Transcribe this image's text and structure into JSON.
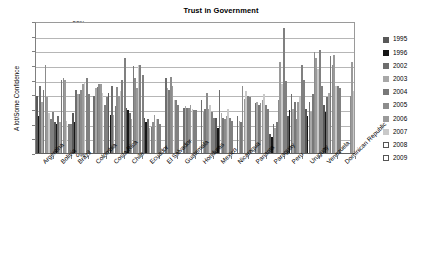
{
  "chart_data": {
    "type": "bar",
    "title": "Trust in Government",
    "xlabel": "",
    "ylabel": "A lot/Some Confidence",
    "ylim": [
      0,
      90
    ],
    "ytick_labels": [
      "0%",
      "10%",
      "20%",
      "30%",
      "40%",
      "50%",
      "60%",
      "70%",
      "80%",
      "90%"
    ],
    "ytick_values": [
      0,
      10,
      20,
      30,
      40,
      50,
      60,
      70,
      80,
      90
    ],
    "grid": true,
    "legend_position": "right",
    "categories": [
      "Argentina",
      "Bolivia",
      "Brazil",
      "Colombia",
      "Costa Rica",
      "Chile",
      "Ecuador",
      "El Salvador",
      "Guatemala",
      "Honduras",
      "Mexico",
      "Nicaragua",
      "Panama",
      "Paraguay",
      "Peru",
      "Uruguay",
      "Venezuela",
      "Dominican Republic"
    ],
    "series": [
      {
        "name": "1995",
        "color": "#595959",
        "values": [
          39,
          21,
          27,
          null,
          41,
          31,
          24,
          null,
          null,
          null,
          24,
          null,
          null,
          13,
          25,
          30,
          33,
          null
        ]
      },
      {
        "name": "1996",
        "color": "#161616",
        "values": [
          25,
          20,
          21,
          null,
          26,
          29,
          21,
          null,
          null,
          null,
          17,
          null,
          null,
          11,
          29,
          25,
          28,
          null
        ]
      },
      {
        "name": "2002",
        "color": "#6e6e6e",
        "values": [
          46,
          25,
          43,
          39,
          46,
          27,
          23,
          51,
          31,
          36,
          43,
          25,
          34,
          20,
          40,
          35,
          38,
          null
        ]
      },
      {
        "name": "2003",
        "color": "#a8a8a8",
        "values": [
          35,
          21,
          40,
          44,
          26,
          23,
          17,
          44,
          32,
          28,
          27,
          22,
          35,
          17,
          30,
          28,
          41,
          null
        ]
      },
      {
        "name": "2004",
        "color": "#787878",
        "values": [
          43,
          50,
          40,
          45,
          32,
          59,
          18,
          43,
          31,
          30,
          24,
          21,
          33,
          21,
          35,
          40,
          66,
          null
        ]
      },
      {
        "name": "2005",
        "color": "#8c8c8c",
        "values": [
          60,
          51,
          43,
          47,
          45,
          51,
          21,
          52,
          31,
          41,
          23,
          46,
          34,
          36,
          23,
          69,
          60,
          39
        ]
      },
      {
        "name": "2006",
        "color": "#9a9a9a",
        "values": [
          38,
          50,
          47,
          47,
          39,
          44,
          26,
          46,
          33,
          30,
          25,
          37,
          36,
          62,
          35,
          65,
          67,
          62
        ]
      },
      {
        "name": "2007",
        "color": "#c9c9c9",
        "values": [
          27,
          22,
          48,
          41,
          42,
          60,
          23,
          36,
          30,
          33,
          30,
          42,
          40,
          47,
          38,
          57,
          46,
          42
        ]
      },
      {
        "name": "2008",
        "color": "#ffffff",
        "values": [
          23,
          20,
          51,
          33,
          50,
          60,
          23,
          36,
          29,
          28,
          24,
          39,
          33,
          85,
          60,
          70,
          46,
          43
        ]
      },
      {
        "name": "2009",
        "color": "#ffffff",
        "values": [
          28,
          20,
          40,
          38,
          65,
          53,
          20,
          33,
          29,
          24,
          22,
          38,
          30,
          49,
          50,
          46,
          44,
          41
        ]
      }
    ]
  },
  "legend": {
    "items": [
      {
        "label": "1995"
      },
      {
        "label": "1996"
      },
      {
        "label": "2002"
      },
      {
        "label": "2003"
      },
      {
        "label": "2004"
      },
      {
        "label": "2005"
      },
      {
        "label": "2006"
      },
      {
        "label": "2007"
      },
      {
        "label": "2008"
      },
      {
        "label": "2009"
      }
    ]
  }
}
